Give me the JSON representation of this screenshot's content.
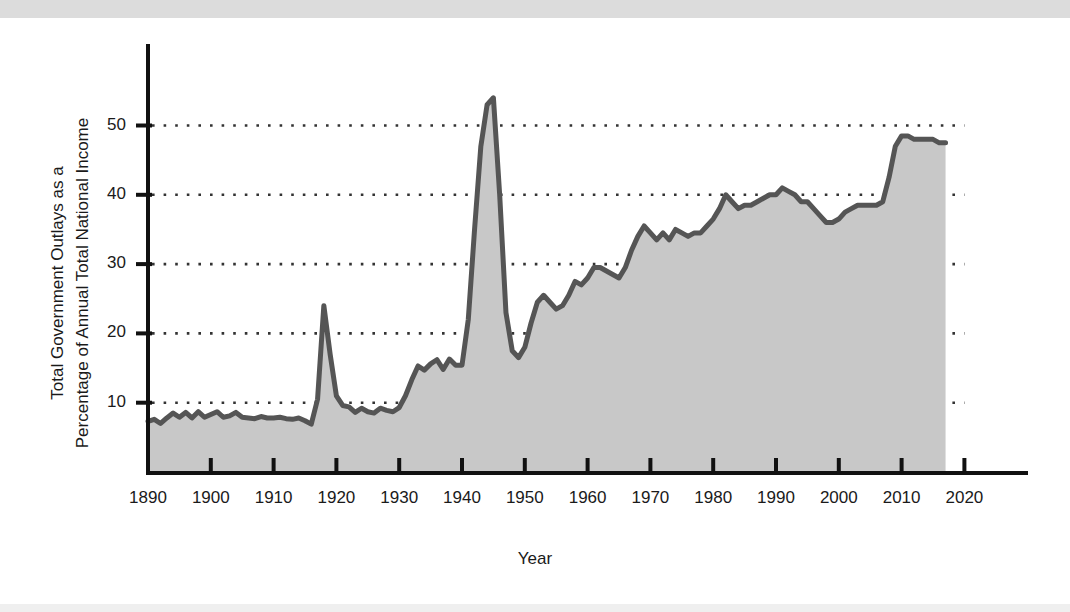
{
  "chart_data": {
    "type": "area",
    "title": "",
    "xlabel": "Year",
    "ylabel": "Total Government Outlays as a Percentage of Annual Total National Income",
    "ylabel_line1": "Total Government Outlays as a",
    "ylabel_line2": "Percentage of Annual Total National Income",
    "xlim": [
      1890,
      2020
    ],
    "ylim": [
      0,
      57
    ],
    "xticks": [
      1890,
      1900,
      1910,
      1920,
      1930,
      1940,
      1950,
      1960,
      1970,
      1980,
      1990,
      2000,
      2010,
      2020
    ],
    "yticks": [
      10,
      20,
      30,
      40,
      50
    ],
    "grid": "dotted-horizontal",
    "legend": "none",
    "colors": {
      "line": "#555555",
      "fill": "#c8c8c8",
      "axis": "#111111",
      "grid": "#333333",
      "background": "#ffffff",
      "top_band": "#dcdcdc"
    },
    "x": [
      1890,
      1891,
      1892,
      1893,
      1894,
      1895,
      1896,
      1897,
      1898,
      1899,
      1900,
      1901,
      1902,
      1903,
      1904,
      1905,
      1906,
      1907,
      1908,
      1909,
      1910,
      1911,
      1912,
      1913,
      1914,
      1915,
      1916,
      1917,
      1918,
      1919,
      1920,
      1921,
      1922,
      1923,
      1924,
      1925,
      1926,
      1927,
      1928,
      1929,
      1930,
      1931,
      1932,
      1933,
      1934,
      1935,
      1936,
      1937,
      1938,
      1939,
      1940,
      1941,
      1942,
      1943,
      1944,
      1945,
      1946,
      1947,
      1948,
      1949,
      1950,
      1951,
      1952,
      1953,
      1954,
      1955,
      1956,
      1957,
      1958,
      1959,
      1960,
      1961,
      1962,
      1963,
      1964,
      1965,
      1966,
      1967,
      1968,
      1969,
      1970,
      1971,
      1972,
      1973,
      1974,
      1975,
      1976,
      1977,
      1978,
      1979,
      1980,
      1981,
      1982,
      1983,
      1984,
      1985,
      1986,
      1987,
      1988,
      1989,
      1990,
      1991,
      1992,
      1993,
      1994,
      1995,
      1996,
      1997,
      1998,
      1999,
      2000,
      2001,
      2002,
      2003,
      2004,
      2005,
      2006,
      2007,
      2008,
      2009,
      2010,
      2011,
      2012,
      2013,
      2014,
      2015,
      2016,
      2017
    ],
    "values": [
      7.3,
      7.6,
      7.0,
      7.8,
      8.5,
      7.9,
      8.6,
      7.8,
      8.7,
      7.9,
      8.3,
      8.7,
      7.9,
      8.1,
      8.6,
      7.9,
      7.8,
      7.7,
      8.0,
      7.8,
      7.8,
      7.9,
      7.7,
      7.6,
      7.8,
      7.4,
      6.9,
      10.5,
      24.0,
      17.0,
      11.0,
      9.6,
      9.4,
      8.6,
      9.2,
      8.7,
      8.5,
      9.2,
      8.9,
      8.7,
      9.3,
      11.0,
      13.3,
      15.3,
      14.7,
      15.6,
      16.2,
      14.8,
      16.3,
      15.4,
      15.4,
      22.0,
      35.0,
      47.0,
      53.0,
      54.0,
      40.0,
      23.0,
      17.5,
      16.5,
      18.0,
      21.5,
      24.5,
      25.5,
      24.5,
      23.5,
      24.0,
      25.5,
      27.5,
      27.0,
      28.0,
      29.5,
      29.5,
      29.0,
      28.5,
      28.0,
      29.5,
      32.0,
      34.0,
      35.5,
      34.5,
      33.5,
      34.5,
      33.5,
      35.0,
      34.5,
      34.0,
      34.5,
      34.5,
      35.5,
      36.5,
      38.0,
      40.0,
      39.0,
      38.0,
      38.5,
      38.5,
      39.0,
      39.5,
      40.0,
      40.0,
      41.0,
      40.5,
      40.0,
      39.0,
      39.0,
      38.0,
      37.0,
      36.0,
      36.0,
      36.5,
      37.5,
      38.0,
      38.5,
      38.5,
      38.5,
      38.5,
      39.0,
      42.5,
      47.0,
      48.5,
      48.5,
      48.0,
      48.0,
      48.0,
      48.0,
      47.5,
      47.5
    ]
  },
  "annotations": {
    "wwi_peak_year": 1918,
    "wwi_peak_value": 24.0,
    "wwii_peak_year": 1945,
    "wwii_peak_value": 54.0,
    "final_year": 2017,
    "final_value": 47.5
  }
}
